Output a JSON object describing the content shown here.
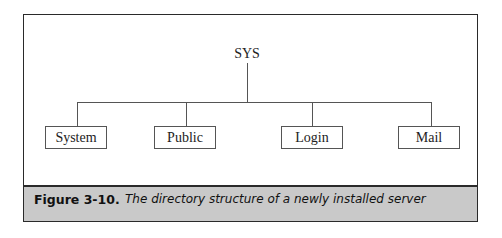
{
  "diagram": {
    "root": "SYS",
    "children": [
      "System",
      "Public",
      "Login",
      "Mail"
    ]
  },
  "caption": {
    "number": "Figure 3-10.",
    "text": "The directory structure of a newly installed server"
  },
  "colors": {
    "caption_background": "#c9c9c9",
    "border": "#2a2a2a",
    "line": "#555555"
  }
}
